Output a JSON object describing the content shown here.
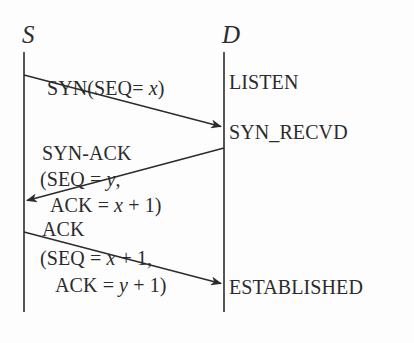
{
  "figure": {
    "background_color": "#fdfdfd",
    "ink_color": "#2b2b2b"
  },
  "endpoints": [
    {
      "id": "source",
      "label": "S",
      "x": 24,
      "lifeline_top": 52,
      "lifeline_bottom": 312
    },
    {
      "id": "destination",
      "label": "D",
      "x": 224,
      "lifeline_top": 52,
      "lifeline_bottom": 312
    }
  ],
  "messages": [
    {
      "id": "syn",
      "direction": "source-to-destination",
      "from_x": 24,
      "from_y": 75,
      "to_x": 222,
      "to_y": 127,
      "lines": [
        {
          "segments": [
            {
              "t": "SYN(SEQ= ",
              "italic": false
            },
            {
              "t": "x",
              "italic": true
            },
            {
              "t": ")",
              "italic": false
            }
          ],
          "x": 47,
          "y": 78
        }
      ]
    },
    {
      "id": "syn-ack",
      "direction": "destination-to-source",
      "from_x": 224,
      "from_y": 148,
      "to_x": 26,
      "to_y": 201,
      "lines": [
        {
          "segments": [
            {
              "t": "SYN-ACK",
              "italic": false
            }
          ],
          "x": 42,
          "y": 143
        },
        {
          "segments": [
            {
              "t": "(SEQ = ",
              "italic": false
            },
            {
              "t": "y",
              "italic": true
            },
            {
              "t": ",",
              "italic": false
            }
          ],
          "x": 40,
          "y": 169
        },
        {
          "segments": [
            {
              "t": "ACK = ",
              "italic": false
            },
            {
              "t": "x",
              "italic": true
            },
            {
              "t": " + 1)",
              "italic": false
            }
          ],
          "x": 50,
          "y": 195
        }
      ]
    },
    {
      "id": "ack",
      "direction": "source-to-destination",
      "from_x": 24,
      "from_y": 232,
      "to_x": 222,
      "to_y": 284,
      "lines": [
        {
          "segments": [
            {
              "t": "ACK",
              "italic": false
            }
          ],
          "x": 42,
          "y": 219
        },
        {
          "segments": [
            {
              "t": "(SEQ = ",
              "italic": false
            },
            {
              "t": "x",
              "italic": true
            },
            {
              "t": " + 1,",
              "italic": false
            }
          ],
          "x": 40,
          "y": 248
        },
        {
          "segments": [
            {
              "t": "ACK = ",
              "italic": false
            },
            {
              "t": "y",
              "italic": true
            },
            {
              "t": " + 1)",
              "italic": false
            }
          ],
          "x": 55,
          "y": 275
        }
      ]
    }
  ],
  "states": [
    {
      "id": "listen",
      "label": "LISTEN",
      "x": 229,
      "y": 72
    },
    {
      "id": "syn-recvd",
      "label": "SYN_RECVD",
      "x": 229,
      "y": 122
    },
    {
      "id": "established",
      "label": "ESTABLISHED",
      "x": 229,
      "y": 277
    }
  ]
}
